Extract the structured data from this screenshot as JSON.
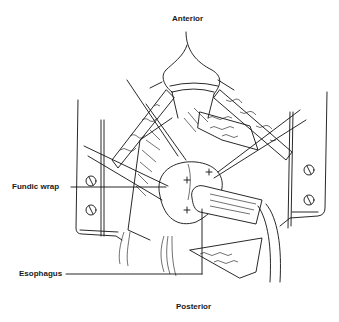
{
  "figure": {
    "labels": {
      "top": "Anterior",
      "bottom": "Posterior",
      "left_upper": "Fundic wrap",
      "left_lower": "Esophagus"
    },
    "colors": {
      "ink": "#111111",
      "background": "#ffffff"
    }
  }
}
